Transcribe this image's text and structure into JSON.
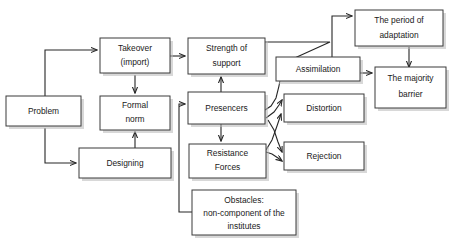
{
  "diagram": {
    "background_color": "#ffffff",
    "box_stroke_color": "#3a3a3a",
    "text_color": "#1a1a1a",
    "connector_color": "#262626",
    "nodes": [
      {
        "id": "problem",
        "label": "Problem",
        "lines": [
          "Problem"
        ]
      },
      {
        "id": "takeover",
        "label": "Takeover (import)",
        "lines": [
          "Takeover",
          "(import)"
        ]
      },
      {
        "id": "formalnorm",
        "label": "Formal norm",
        "lines": [
          "Formal",
          "norm"
        ]
      },
      {
        "id": "designing",
        "label": "Designing",
        "lines": [
          "Designing"
        ]
      },
      {
        "id": "strength",
        "label": "Strength of support",
        "lines": [
          "Strength of",
          "support"
        ]
      },
      {
        "id": "presencers",
        "label": "Presencers",
        "lines": [
          "Presencers"
        ]
      },
      {
        "id": "resistance",
        "label": "Resistance Forces",
        "lines": [
          "Resistance",
          "Forces"
        ]
      },
      {
        "id": "obstacles",
        "label": "Obstacles: non-component of the institutes",
        "lines": [
          "Obstacles:",
          "non-component of the",
          "institutes"
        ]
      },
      {
        "id": "assimilation",
        "label": "Assimilation",
        "lines": [
          "Assimilation"
        ]
      },
      {
        "id": "distortion",
        "label": "Distortion",
        "lines": [
          "Distortion"
        ]
      },
      {
        "id": "rejection",
        "label": "Rejection",
        "lines": [
          "Rejection"
        ]
      },
      {
        "id": "period",
        "label": "The period of adaptation",
        "lines": [
          "The period of",
          "adaptation"
        ]
      },
      {
        "id": "majority",
        "label": "The majority barrier",
        "lines": [
          "The majority",
          "barrier"
        ]
      }
    ],
    "edges": [
      {
        "from": "problem",
        "to": "takeover"
      },
      {
        "from": "problem",
        "to": "designing"
      },
      {
        "from": "takeover",
        "to": "formalnorm"
      },
      {
        "from": "takeover",
        "to": "strength"
      },
      {
        "from": "designing",
        "to": "formalnorm"
      },
      {
        "from": "presencers",
        "to": "strength"
      },
      {
        "from": "presencers",
        "to": "resistance"
      },
      {
        "from": "obstacles",
        "to": "presencers"
      },
      {
        "from": "strength",
        "to": "assimilation"
      },
      {
        "from": "presencers",
        "to": "assimilation"
      },
      {
        "from": "presencers",
        "to": "distortion"
      },
      {
        "from": "presencers",
        "to": "rejection"
      },
      {
        "from": "resistance",
        "to": "distortion"
      },
      {
        "from": "resistance",
        "to": "rejection"
      },
      {
        "from": "assimilation",
        "to": "period"
      },
      {
        "from": "assimilation",
        "to": "majority"
      },
      {
        "from": "period",
        "to": "majority"
      }
    ]
  }
}
